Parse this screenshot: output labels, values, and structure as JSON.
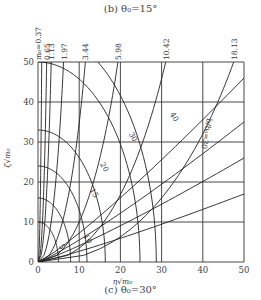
{
  "header": {
    "title": "(b) θ₀=15°"
  },
  "footer": {
    "caption": "(c) θ₀=30°"
  },
  "chart_data": {
    "type": "line",
    "title": "(c) θ₀=30°",
    "xlabel": "η√m₀",
    "ylabel": "ζ√m₀",
    "xlim": [
      0,
      50
    ],
    "ylim": [
      0,
      50
    ],
    "grid": true,
    "x_ticks": [
      0,
      10,
      20,
      30,
      40,
      50
    ],
    "y_ticks": [
      0,
      10,
      20,
      30,
      40,
      50
    ],
    "x_tick_labels": [
      "0",
      "10",
      "20",
      "30",
      "40",
      "50"
    ],
    "y_tick_labels": [
      "0",
      "10",
      "20",
      "30",
      "40",
      "50"
    ],
    "top_labels": [
      "m₀=0.37",
      "0.65",
      "1.13",
      "1.97",
      "3.44",
      "5.98",
      "10.42",
      "18.13"
    ],
    "m_curves": [
      {
        "name": "0.37",
        "x_top": 0.9
      },
      {
        "name": "0.65",
        "x_top": 2.1
      },
      {
        "name": "1.13",
        "x_top": 3.2
      },
      {
        "name": "1.97",
        "x_top": 6.2
      },
      {
        "name": "3.44",
        "x_top": 11.5
      },
      {
        "name": "5.98",
        "x_top": 19.4
      },
      {
        "name": "10.42",
        "x_top": 31.0
      },
      {
        "name": "18.13",
        "x_top": 47.5
      }
    ],
    "arc_curves": [
      {
        "name": "5",
        "radius": 10
      },
      {
        "name": "10",
        "radius": 16
      },
      {
        "name": "15",
        "radius": 24
      },
      {
        "name": "20",
        "radius": 33
      },
      {
        "name": "30",
        "radius": 50
      },
      {
        "name": "40",
        "radius": 58
      }
    ],
    "ray_label": "b/b₀=30",
    "annotations": [
      "5",
      "10",
      "15",
      "20",
      "30",
      "40",
      "b/b₀=30"
    ]
  }
}
